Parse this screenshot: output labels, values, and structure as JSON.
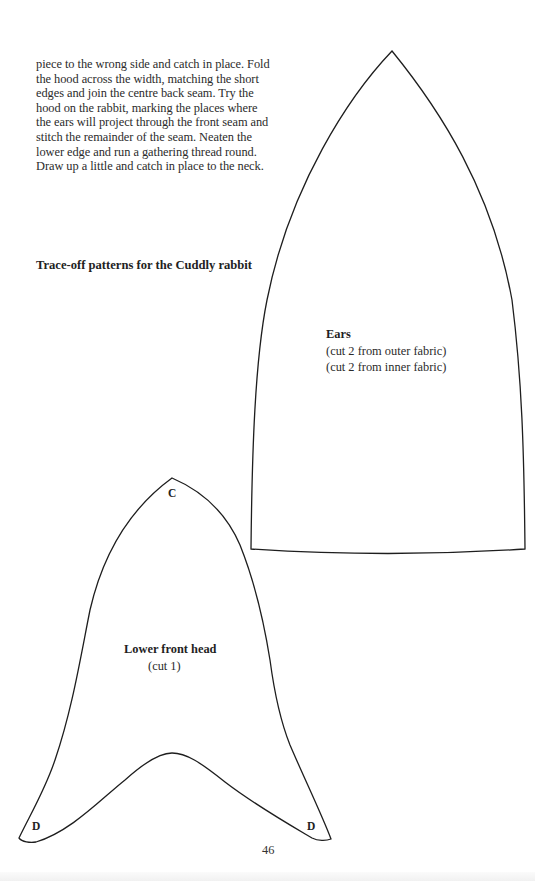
{
  "body_text": "piece to the wrong side and catch in place. Fold the hood across the width, matching the short edges and join the centre back seam. Try the hood on the rabbit, marking the places where the ears will project through the front seam and stitch the remainder of the seam. Neaten the lower edge and run a gathering thread round. Draw up a little and catch in place to the neck.",
  "section_heading": "Trace-off patterns for the Cuddly rabbit",
  "patterns": {
    "ears": {
      "title": "Ears",
      "instructions": [
        "(cut 2 from outer fabric)",
        "(cut 2 from inner fabric)"
      ]
    },
    "lower_front_head": {
      "title": "Lower front head",
      "instruction": "(cut 1)",
      "points": {
        "top": "C",
        "bottom_left": "D",
        "bottom_right": "D"
      }
    }
  },
  "page_number": "46"
}
